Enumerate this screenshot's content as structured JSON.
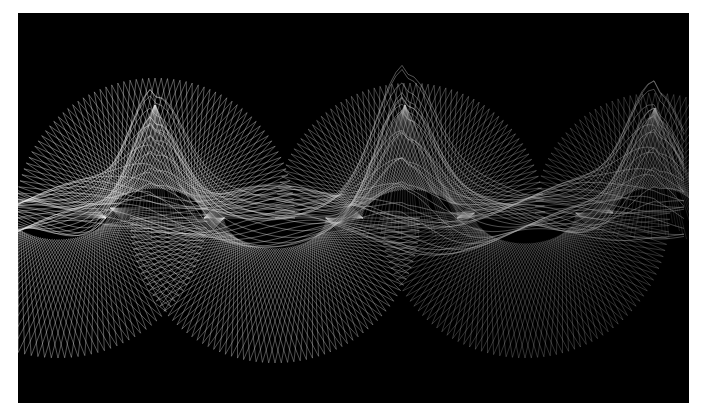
{
  "artwork": {
    "subject": "abstract string-art wave",
    "background_color": "#000000",
    "page_color": "#ffffff",
    "line_color_left": "#f2f2f2",
    "line_color_right": "#9a9a9a",
    "frame": {
      "x": 18,
      "y": 13,
      "width": 671,
      "height": 390
    },
    "dome_fans": [
      {
        "cx": 137,
        "cy": 205,
        "r": 140,
        "spokes": 70,
        "opacity": 0.85
      },
      {
        "cx": 392,
        "cy": 205,
        "r": 135,
        "spokes": 70,
        "opacity": 0.75
      },
      {
        "cx": 637,
        "cy": 200,
        "r": 120,
        "spokes": 60,
        "opacity": 0.6
      }
    ],
    "bowl_fans": [
      {
        "cx": 40,
        "cy": 195,
        "r": 150,
        "spokes": 70,
        "opacity": 0.75
      },
      {
        "cx": 257,
        "cy": 205,
        "r": 145,
        "spokes": 72,
        "opacity": 0.8
      },
      {
        "cx": 507,
        "cy": 200,
        "r": 145,
        "spokes": 72,
        "opacity": 0.6
      }
    ],
    "band": {
      "y_center": 200,
      "peaks": [
        {
          "x": 137,
          "y": 92
        },
        {
          "x": 387,
          "y": 92
        },
        {
          "x": 637,
          "y": 95
        }
      ],
      "strands": 28,
      "opacity": 0.55
    }
  }
}
